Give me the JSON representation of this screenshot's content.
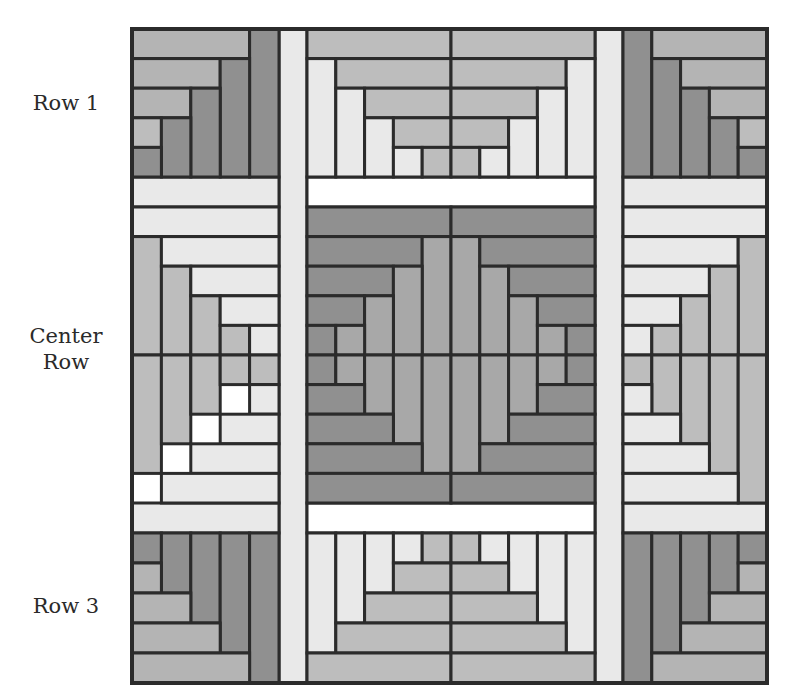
{
  "labels": {
    "row1": "Row 1",
    "center_line1": "Center",
    "center_line2": "Row",
    "row3": "Row 3"
  },
  "colors": {
    "line": "#2b2b2b",
    "dark": "#909090",
    "medium": "#a8a8a8",
    "mediumlight": "#b4b4b4",
    "lightgray": "#bdbdbd",
    "light": "#e9e9e9",
    "white": "#ffffff"
  },
  "quilt": {
    "outer": {
      "x": 132,
      "y": 29,
      "w": 635,
      "h": 654
    },
    "cols": [
      132,
      279,
      307,
      595,
      623,
      767
    ],
    "rows": [
      29,
      177,
      207,
      503,
      533,
      683
    ],
    "sashing": [
      {
        "x": 279,
        "y": 29,
        "w": 28,
        "h": 654,
        "fill": "light"
      },
      {
        "x": 595,
        "y": 29,
        "w": 28,
        "h": 654,
        "fill": "light"
      },
      {
        "x": 132,
        "y": 177,
        "w": 147,
        "h": 30,
        "fill": "light"
      },
      {
        "x": 307,
        "y": 177,
        "w": 288,
        "h": 30,
        "fill": "white"
      },
      {
        "x": 623,
        "y": 177,
        "w": 144,
        "h": 30,
        "fill": "light"
      },
      {
        "x": 132,
        "y": 503,
        "w": 147,
        "h": 30,
        "fill": "light"
      },
      {
        "x": 307,
        "y": 503,
        "w": 288,
        "h": 30,
        "fill": "white"
      },
      {
        "x": 623,
        "y": 503,
        "w": 144,
        "h": 30,
        "fill": "light"
      }
    ],
    "blocks": [
      {
        "name": "row1-left",
        "x": 132,
        "y": 29,
        "w": 147,
        "h": 148,
        "ux": 5,
        "uy": 5,
        "rects": [
          [
            0,
            0,
            4,
            1,
            "mediumlight"
          ],
          [
            4,
            0,
            1,
            5,
            "dark"
          ],
          [
            0,
            1,
            3,
            1,
            "mediumlight"
          ],
          [
            3,
            1,
            1,
            4,
            "dark"
          ],
          [
            0,
            2,
            2,
            1,
            "mediumlight"
          ],
          [
            2,
            2,
            1,
            3,
            "dark"
          ],
          [
            0,
            3,
            1,
            1,
            "lightgray"
          ],
          [
            1,
            3,
            1,
            2,
            "dark"
          ],
          [
            0,
            4,
            1,
            1,
            "dark"
          ]
        ]
      },
      {
        "name": "row1-center",
        "x": 307,
        "y": 29,
        "w": 288,
        "h": 148,
        "ux": 10,
        "uy": 5,
        "rects": [
          [
            0,
            0,
            5,
            1,
            "lightgray"
          ],
          [
            5,
            0,
            5,
            1,
            "lightgray"
          ],
          [
            0,
            1,
            1,
            4,
            "light"
          ],
          [
            1,
            1,
            4,
            1,
            "lightgray"
          ],
          [
            5,
            1,
            4,
            1,
            "lightgray"
          ],
          [
            9,
            1,
            1,
            4,
            "light"
          ],
          [
            1,
            2,
            1,
            3,
            "light"
          ],
          [
            2,
            2,
            3,
            1,
            "lightgray"
          ],
          [
            5,
            2,
            3,
            1,
            "lightgray"
          ],
          [
            8,
            2,
            1,
            3,
            "light"
          ],
          [
            2,
            3,
            1,
            2,
            "light"
          ],
          [
            3,
            3,
            2,
            1,
            "lightgray"
          ],
          [
            5,
            3,
            2,
            1,
            "lightgray"
          ],
          [
            7,
            3,
            1,
            2,
            "light"
          ],
          [
            3,
            4,
            1,
            1,
            "light"
          ],
          [
            4,
            4,
            1,
            1,
            "lightgray"
          ],
          [
            5,
            4,
            1,
            1,
            "lightgray"
          ],
          [
            6,
            4,
            1,
            1,
            "light"
          ]
        ]
      },
      {
        "name": "row1-right",
        "x": 623,
        "y": 29,
        "w": 144,
        "h": 148,
        "ux": 5,
        "uy": 5,
        "rects": [
          [
            0,
            0,
            1,
            5,
            "dark"
          ],
          [
            1,
            0,
            4,
            1,
            "mediumlight"
          ],
          [
            1,
            1,
            1,
            4,
            "dark"
          ],
          [
            2,
            1,
            3,
            1,
            "mediumlight"
          ],
          [
            2,
            2,
            1,
            3,
            "dark"
          ],
          [
            3,
            2,
            2,
            1,
            "mediumlight"
          ],
          [
            3,
            3,
            1,
            2,
            "dark"
          ],
          [
            4,
            3,
            1,
            1,
            "lightgray"
          ],
          [
            4,
            4,
            1,
            1,
            "dark"
          ]
        ]
      },
      {
        "name": "center-left-top",
        "x": 132,
        "y": 207,
        "w": 147,
        "h": 148,
        "ux": 5,
        "uy": 5,
        "rects": [
          [
            0,
            0,
            5,
            1,
            "light"
          ],
          [
            0,
            1,
            1,
            4,
            "lightgray"
          ],
          [
            1,
            1,
            4,
            1,
            "light"
          ],
          [
            1,
            2,
            1,
            3,
            "lightgray"
          ],
          [
            2,
            2,
            3,
            1,
            "light"
          ],
          [
            2,
            3,
            1,
            2,
            "lightgray"
          ],
          [
            3,
            3,
            2,
            1,
            "light"
          ],
          [
            3,
            4,
            1,
            1,
            "lightgray"
          ],
          [
            4,
            4,
            1,
            1,
            "light"
          ]
        ]
      },
      {
        "name": "center-left-bottom",
        "x": 132,
        "y": 355,
        "w": 147,
        "h": 148,
        "ux": 5,
        "uy": 5,
        "rects": [
          [
            0,
            0,
            1,
            4,
            "lightgray"
          ],
          [
            1,
            0,
            1,
            3,
            "lightgray"
          ],
          [
            2,
            0,
            1,
            2,
            "lightgray"
          ],
          [
            3,
            0,
            1,
            1,
            "lightgray"
          ],
          [
            4,
            0,
            1,
            1,
            "lightgray"
          ],
          [
            4,
            1,
            1,
            1,
            "light"
          ],
          [
            3,
            2,
            2,
            1,
            "light"
          ],
          [
            2,
            3,
            3,
            1,
            "light"
          ],
          [
            1,
            4,
            4,
            1,
            "light"
          ],
          [
            0,
            5,
            5,
            1,
            "light"
          ]
        ]
      },
      {
        "name": "center-middle",
        "x": 307,
        "y": 207,
        "w": 288,
        "h": 296,
        "ux": 10,
        "uy": 10,
        "rects": [
          [
            0,
            0,
            5,
            1,
            "dark"
          ],
          [
            5,
            0,
            5,
            1,
            "dark"
          ],
          [
            0,
            1,
            4,
            1,
            "dark"
          ],
          [
            4,
            1,
            1,
            4,
            "medium"
          ],
          [
            5,
            1,
            1,
            4,
            "medium"
          ],
          [
            6,
            1,
            4,
            1,
            "dark"
          ],
          [
            0,
            2,
            3,
            1,
            "dark"
          ],
          [
            3,
            2,
            1,
            3,
            "medium"
          ],
          [
            6,
            2,
            1,
            3,
            "medium"
          ],
          [
            7,
            2,
            3,
            1,
            "dark"
          ],
          [
            0,
            3,
            2,
            1,
            "dark"
          ],
          [
            2,
            3,
            1,
            2,
            "medium"
          ],
          [
            7,
            3,
            1,
            2,
            "medium"
          ],
          [
            8,
            3,
            2,
            1,
            "dark"
          ],
          [
            0,
            4,
            1,
            1,
            "dark"
          ],
          [
            1,
            4,
            1,
            1,
            "medium"
          ],
          [
            8,
            4,
            1,
            1,
            "medium"
          ],
          [
            9,
            4,
            1,
            1,
            "dark"
          ],
          [
            0,
            5,
            1,
            1,
            "dark"
          ],
          [
            1,
            5,
            1,
            1,
            "medium"
          ],
          [
            2,
            5,
            1,
            2,
            "medium"
          ],
          [
            3,
            5,
            1,
            3,
            "medium"
          ],
          [
            4,
            5,
            1,
            4,
            "medium"
          ],
          [
            5,
            5,
            1,
            4,
            "medium"
          ],
          [
            6,
            5,
            1,
            3,
            "medium"
          ],
          [
            7,
            5,
            1,
            2,
            "medium"
          ],
          [
            8,
            5,
            1,
            1,
            "medium"
          ],
          [
            9,
            5,
            1,
            1,
            "dark"
          ],
          [
            0,
            6,
            2,
            1,
            "dark"
          ],
          [
            8,
            6,
            2,
            1,
            "dark"
          ],
          [
            0,
            7,
            3,
            1,
            "dark"
          ],
          [
            7,
            7,
            3,
            1,
            "dark"
          ],
          [
            0,
            8,
            4,
            1,
            "dark"
          ],
          [
            6,
            8,
            4,
            1,
            "dark"
          ],
          [
            0,
            9,
            5,
            1,
            "dark"
          ],
          [
            5,
            9,
            5,
            1,
            "dark"
          ]
        ]
      },
      {
        "name": "center-right-top",
        "x": 623,
        "y": 207,
        "w": 144,
        "h": 148,
        "ux": 5,
        "uy": 5,
        "rects": [
          [
            0,
            0,
            5,
            1,
            "light"
          ],
          [
            0,
            1,
            4,
            1,
            "light"
          ],
          [
            4,
            1,
            1,
            4,
            "lightgray"
          ],
          [
            0,
            2,
            3,
            1,
            "light"
          ],
          [
            3,
            2,
            1,
            3,
            "lightgray"
          ],
          [
            0,
            3,
            2,
            1,
            "light"
          ],
          [
            2,
            3,
            1,
            2,
            "lightgray"
          ],
          [
            0,
            4,
            1,
            1,
            "light"
          ],
          [
            1,
            4,
            1,
            1,
            "lightgray"
          ]
        ]
      },
      {
        "name": "center-right-bottom",
        "x": 623,
        "y": 355,
        "w": 144,
        "h": 148,
        "ux": 5,
        "uy": 5,
        "rects": [
          [
            0,
            0,
            1,
            1,
            "lightgray"
          ],
          [
            1,
            0,
            1,
            2,
            "lightgray"
          ],
          [
            2,
            0,
            1,
            3,
            "lightgray"
          ],
          [
            3,
            0,
            1,
            4,
            "lightgray"
          ],
          [
            4,
            0,
            1,
            5,
            "lightgray"
          ],
          [
            0,
            1,
            1,
            1,
            "light"
          ],
          [
            0,
            2,
            2,
            1,
            "light"
          ],
          [
            0,
            3,
            3,
            1,
            "light"
          ],
          [
            0,
            4,
            4,
            1,
            "light"
          ],
          [
            0,
            5,
            5,
            1,
            "light"
          ]
        ]
      },
      {
        "name": "row3-left",
        "x": 132,
        "y": 533,
        "w": 147,
        "h": 150,
        "ux": 5,
        "uy": 5,
        "rects": [
          [
            0,
            0,
            1,
            1,
            "dark"
          ],
          [
            1,
            0,
            1,
            2,
            "dark"
          ],
          [
            2,
            0,
            1,
            3,
            "dark"
          ],
          [
            3,
            0,
            1,
            4,
            "dark"
          ],
          [
            4,
            0,
            1,
            5,
            "dark"
          ],
          [
            0,
            1,
            1,
            1,
            "mediumlight"
          ],
          [
            0,
            2,
            2,
            1,
            "mediumlight"
          ],
          [
            0,
            3,
            3,
            1,
            "mediumlight"
          ],
          [
            0,
            4,
            4,
            1,
            "mediumlight"
          ]
        ]
      },
      {
        "name": "row3-center",
        "x": 307,
        "y": 533,
        "w": 288,
        "h": 150,
        "ux": 10,
        "uy": 5,
        "rects": [
          [
            0,
            0,
            1,
            4,
            "light"
          ],
          [
            1,
            0,
            1,
            3,
            "light"
          ],
          [
            2,
            0,
            1,
            2,
            "light"
          ],
          [
            3,
            0,
            1,
            1,
            "light"
          ],
          [
            4,
            0,
            1,
            1,
            "lightgray"
          ],
          [
            5,
            0,
            1,
            1,
            "lightgray"
          ],
          [
            6,
            0,
            1,
            1,
            "light"
          ],
          [
            7,
            0,
            1,
            2,
            "light"
          ],
          [
            8,
            0,
            1,
            3,
            "light"
          ],
          [
            9,
            0,
            1,
            4,
            "light"
          ],
          [
            3,
            1,
            2,
            1,
            "lightgray"
          ],
          [
            5,
            1,
            2,
            1,
            "lightgray"
          ],
          [
            2,
            2,
            3,
            1,
            "lightgray"
          ],
          [
            5,
            2,
            3,
            1,
            "lightgray"
          ],
          [
            1,
            3,
            4,
            1,
            "lightgray"
          ],
          [
            5,
            3,
            4,
            1,
            "lightgray"
          ],
          [
            0,
            4,
            5,
            1,
            "lightgray"
          ],
          [
            5,
            4,
            5,
            1,
            "lightgray"
          ]
        ]
      },
      {
        "name": "row3-right",
        "x": 623,
        "y": 533,
        "w": 144,
        "h": 150,
        "ux": 5,
        "uy": 5,
        "rects": [
          [
            0,
            0,
            1,
            5,
            "dark"
          ],
          [
            1,
            0,
            1,
            4,
            "dark"
          ],
          [
            2,
            0,
            1,
            3,
            "dark"
          ],
          [
            3,
            0,
            1,
            2,
            "dark"
          ],
          [
            4,
            0,
            1,
            1,
            "dark"
          ],
          [
            4,
            1,
            1,
            1,
            "mediumlight"
          ],
          [
            3,
            2,
            2,
            1,
            "mediumlight"
          ],
          [
            2,
            3,
            3,
            1,
            "mediumlight"
          ],
          [
            1,
            4,
            4,
            1,
            "mediumlight"
          ]
        ]
      }
    ]
  }
}
